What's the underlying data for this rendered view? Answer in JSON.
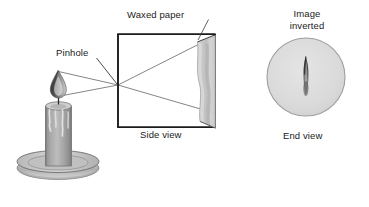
{
  "figure": {
    "background_color": "#ffffff",
    "line_color": "#1b1b1b",
    "ray_color": "#6b6b6b",
    "text_color": "#1b1b1b"
  },
  "labels": {
    "waxed_paper": "Waxed paper",
    "pinhole": "Pinhole",
    "side_view": "Side view",
    "image_inverted_line1": "Image",
    "image_inverted_line2": "inverted",
    "end_view": "End view"
  },
  "objects": {
    "candle": {
      "name": "candle",
      "body_color": "#9a9a9a",
      "body_highlight": "#c2c2c2",
      "holder_color": "#b5b5b5",
      "flame_color": "#4a4a4a",
      "wick_color": "#2a2a2a"
    },
    "box": {
      "name": "pinhole-box",
      "stroke": "#1b1b1b",
      "stroke_width": "1.6"
    },
    "screen": {
      "name": "waxed-paper-screen",
      "fill": "#c9c9c9",
      "fill_light": "#dedede",
      "edge": "#8a8a8a"
    },
    "end_view_circle": {
      "name": "end-view-circle",
      "fill": "#dcdcdc",
      "stroke": "#9a9a9a"
    },
    "inverted_flame": {
      "name": "inverted-flame-image",
      "color": "#555555"
    }
  },
  "rays": {
    "count": 2,
    "description_1": "ray from flame tip through pinhole to lower screen",
    "description_2": "ray from flame base through pinhole to upper screen"
  },
  "geometry": {
    "pinhole_x": 118,
    "pinhole_y": 85,
    "box_left": 118,
    "box_right": 215,
    "box_top": 34,
    "box_bottom": 127,
    "flame_top_y": 70,
    "flame_bottom_y": 96,
    "end_view_cx": 306,
    "end_view_cy": 77,
    "end_view_r": 39
  }
}
